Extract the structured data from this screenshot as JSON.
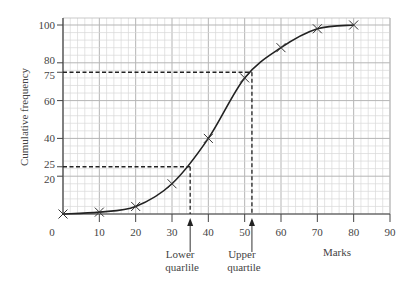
{
  "chart_data": {
    "type": "line",
    "title": "",
    "xlabel": "Marks",
    "ylabel": "Cumulative frequency",
    "xlim": [
      0,
      90
    ],
    "ylim": [
      0,
      100
    ],
    "x_ticks": [
      0,
      10,
      20,
      30,
      40,
      50,
      60,
      70,
      80,
      90
    ],
    "y_ticks": [
      20,
      25,
      40,
      60,
      75,
      80,
      100
    ],
    "grid": true,
    "legend": null,
    "series": [
      {
        "name": "Cumulative frequency",
        "x": [
          0,
          10,
          20,
          30,
          40,
          50,
          60,
          70,
          80
        ],
        "y": [
          0,
          1,
          4,
          16,
          40,
          72,
          88,
          98,
          100
        ],
        "marker": "x",
        "smooth": true
      }
    ],
    "reference_lines": [
      {
        "name": "Lower quartile",
        "y": 25,
        "x": 35,
        "style": "dashed"
      },
      {
        "name": "Upper quartile",
        "y": 75,
        "x": 52,
        "style": "dashed"
      }
    ],
    "annotations": [
      {
        "text": "Lower quartile",
        "line1": "Lower",
        "line2": "quarlile",
        "x": 35,
        "arrow": true
      },
      {
        "text": "Upper quartile",
        "line1": "Upper",
        "line2": "quartile",
        "x": 52,
        "arrow": true
      }
    ]
  }
}
